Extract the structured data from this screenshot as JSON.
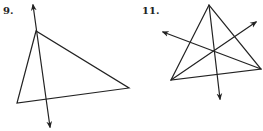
{
  "figures": [
    {
      "label": "9.",
      "triangle": [
        [
          36,
          31
        ],
        [
          17,
          103
        ],
        [
          129,
          88
        ]
      ],
      "lines": [
        {
          "from": [
            33,
            5
          ],
          "to": [
            50,
            127
          ],
          "arrows": "both"
        }
      ]
    },
    {
      "label": "11.",
      "triangle": [
        [
          209,
          5
        ],
        [
          171,
          80
        ],
        [
          261,
          69
        ]
      ],
      "lines": [
        {
          "from": [
            209,
            5
          ],
          "to": [
            220,
            99
          ],
          "arrows": "end"
        },
        {
          "from": [
            171,
            80
          ],
          "to": [
            256,
            22
          ],
          "arrows": "end"
        },
        {
          "from": [
            261,
            69
          ],
          "to": [
            163,
            32
          ],
          "arrows": "end"
        }
      ]
    }
  ],
  "colors": {
    "stroke": "#222222",
    "background": "#ffffff"
  }
}
